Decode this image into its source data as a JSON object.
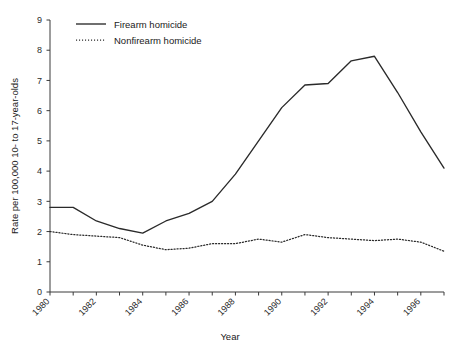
{
  "chart_data": {
    "type": "line",
    "title": "",
    "xlabel": "Year",
    "ylabel": "Rate per 100,000 10- to 17-year-olds",
    "x": [
      1980,
      1981,
      1982,
      1983,
      1984,
      1985,
      1986,
      1987,
      1988,
      1989,
      1990,
      1991,
      1992,
      1993,
      1994,
      1995,
      1996,
      1997
    ],
    "xlim": [
      1980,
      1997
    ],
    "ylim": [
      0,
      9
    ],
    "xticks": [
      1980,
      1982,
      1984,
      1986,
      1988,
      1990,
      1992,
      1994,
      1996
    ],
    "xtick_labels": [
      "1980",
      "1982",
      "1984",
      "1986",
      "1988",
      "1990",
      "1992",
      "1994",
      "1996"
    ],
    "xticks_minor": [
      1981,
      1983,
      1985,
      1987,
      1989,
      1991,
      1993,
      1995,
      1997
    ],
    "yticks": [
      0,
      1,
      2,
      3,
      4,
      5,
      6,
      7,
      8,
      9
    ],
    "ytick_labels": [
      "0",
      "1",
      "2",
      "3",
      "4",
      "5",
      "6",
      "7",
      "8",
      "9"
    ],
    "grid": false,
    "legend_position": "top-left",
    "series": [
      {
        "name": "Firearm homicide",
        "style": "solid",
        "color": "#2a2a2a",
        "values": [
          2.8,
          2.8,
          2.35,
          2.1,
          1.95,
          2.35,
          2.6,
          3.0,
          3.9,
          5.0,
          6.1,
          6.85,
          6.9,
          7.65,
          7.8,
          6.6,
          5.3,
          4.1
        ]
      },
      {
        "name": "Nonfirearm homicide",
        "style": "dotted",
        "color": "#2a2a2a",
        "values": [
          2.0,
          1.9,
          1.85,
          1.8,
          1.55,
          1.4,
          1.45,
          1.6,
          1.6,
          1.75,
          1.65,
          1.9,
          1.8,
          1.75,
          1.7,
          1.75,
          1.65,
          1.35
        ]
      }
    ]
  },
  "legend": {
    "items": [
      {
        "label": "Firearm homicide",
        "style": "solid"
      },
      {
        "label": "Nonfirearm homicide",
        "style": "dotted"
      }
    ]
  },
  "axes": {
    "x_title": "Year",
    "y_title": "Rate per 100,000 10- to 17-year-olds"
  }
}
